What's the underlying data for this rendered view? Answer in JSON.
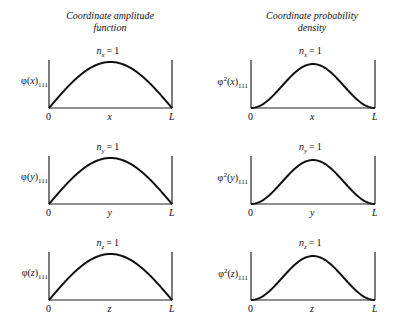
{
  "columns": [
    {
      "title_line1": "Coordinate amplitude",
      "title_line2": "function"
    },
    {
      "title_line1": "Coordinate probability",
      "title_line2": "density"
    }
  ],
  "rows": [
    {
      "quantum_label": "nₓ = 1",
      "n_sub": "x",
      "var": "x",
      "amp_label": "φ(x)",
      "dens_label": "φ²(x)",
      "sub": "111"
    },
    {
      "quantum_label": "nᵧ = 1",
      "n_sub": "y",
      "var": "y",
      "amp_label": "φ(y)",
      "dens_label": "φ²(y)",
      "sub": "111"
    },
    {
      "quantum_label": "n_z = 1",
      "n_sub": "z",
      "var": "z",
      "amp_label": "φ(z)",
      "dens_label": "φ²(z)",
      "sub": "111"
    }
  ],
  "axis": {
    "start": "0",
    "end": "L"
  },
  "chart_data": {
    "type": "line",
    "panels": [
      {
        "column": "Coordinate amplitude function",
        "ylabel": "φ(x)_111",
        "xlabel": "x",
        "curve": "sin(πx/L)",
        "n": 1
      },
      {
        "column": "Coordinate probability density",
        "ylabel": "φ²(x)_111",
        "xlabel": "x",
        "curve": "sin²(πx/L)",
        "n": 1
      },
      {
        "column": "Coordinate amplitude function",
        "ylabel": "φ(y)_111",
        "xlabel": "y",
        "curve": "sin(πy/L)",
        "n": 1
      },
      {
        "column": "Coordinate probability density",
        "ylabel": "φ²(y)_111",
        "xlabel": "y",
        "curve": "sin²(πy/L)",
        "n": 1
      },
      {
        "column": "Coordinate amplitude function",
        "ylabel": "φ(z)_111",
        "xlabel": "z",
        "curve": "sin(πz/L)",
        "n": 1
      },
      {
        "column": "Coordinate probability density",
        "ylabel": "φ²(z)_111",
        "xlabel": "z",
        "curve": "sin²(πz/L)",
        "n": 1
      }
    ],
    "x_ticks": [
      "0",
      "L"
    ]
  }
}
